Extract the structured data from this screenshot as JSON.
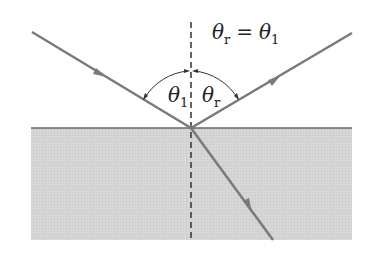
{
  "diagram": {
    "equation": {
      "lhs_symbol": "θ",
      "lhs_sub": "r",
      "op": "=",
      "rhs_symbol": "θ",
      "rhs_sub": "1"
    },
    "angle_labels": [
      {
        "symbol": "θ",
        "sub": "1"
      },
      {
        "symbol": "θ",
        "sub": "r"
      }
    ],
    "colors": {
      "ray": "#7a7a7a",
      "medium": "#d4d4d4",
      "normal": "#333333",
      "text": "#222222"
    }
  }
}
